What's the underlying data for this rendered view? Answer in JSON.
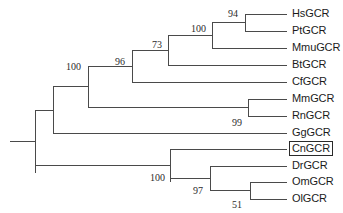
{
  "figure": {
    "type": "phylogenetic-tree",
    "layout": "rectangular-cladogram",
    "background_color": "#ffffff",
    "line_color": "#4a4a4a",
    "text_color": "#1b1b1b",
    "width": 343,
    "height": 213
  },
  "taxa": [
    {
      "id": "hs",
      "label": "HsGCR",
      "y": 14,
      "tip_x": 287,
      "branch_start_x": 245,
      "highlighted": false
    },
    {
      "id": "pt",
      "label": "PtGCR",
      "y": 31,
      "tip_x": 287,
      "branch_start_x": 245,
      "highlighted": false
    },
    {
      "id": "mmu",
      "label": "MmuGCR",
      "y": 48,
      "tip_x": 287,
      "branch_start_x": 212,
      "highlighted": false
    },
    {
      "id": "bt",
      "label": "BtGCR",
      "y": 65,
      "tip_x": 287,
      "branch_start_x": 168,
      "highlighted": false
    },
    {
      "id": "cf",
      "label": "CfGCR",
      "y": 82,
      "tip_x": 287,
      "branch_start_x": 132,
      "highlighted": false
    },
    {
      "id": "mm",
      "label": "MmGCR",
      "y": 99,
      "tip_x": 287,
      "branch_start_x": 248,
      "highlighted": false
    },
    {
      "id": "rn",
      "label": "RnGCR",
      "y": 116,
      "tip_x": 287,
      "branch_start_x": 248,
      "highlighted": false
    },
    {
      "id": "gg",
      "label": "GgGCR",
      "y": 133,
      "tip_x": 287,
      "branch_start_x": 53,
      "highlighted": false
    },
    {
      "id": "cn",
      "label": "CnGCR",
      "y": 149,
      "tip_x": 287,
      "branch_start_x": 170,
      "highlighted": true
    },
    {
      "id": "dr",
      "label": "DrGCR",
      "y": 166,
      "tip_x": 287,
      "branch_start_x": 210,
      "highlighted": false
    },
    {
      "id": "om",
      "label": "OmGCR",
      "y": 182,
      "tip_x": 287,
      "branch_start_x": 250,
      "highlighted": false
    },
    {
      "id": "ol",
      "label": "OlGCR",
      "y": 199,
      "tip_x": 287,
      "branch_start_x": 250,
      "highlighted": false
    }
  ],
  "internal_nodes": [
    {
      "id": "n-hs-pt",
      "bootstrap": "94",
      "x": 245,
      "y_top": 14,
      "y_bottom": 31,
      "parent_x": 212,
      "label_x": 228,
      "label_y": 9
    },
    {
      "id": "n-primates",
      "bootstrap": "100",
      "x": 212,
      "y_top": 22,
      "y_bottom": 48,
      "parent_x": 168,
      "label_x": 191,
      "label_y": 24
    },
    {
      "id": "n-euarchonta",
      "bootstrap": "73",
      "x": 168,
      "y_top": 35,
      "y_bottom": 65,
      "parent_x": 132,
      "label_x": 152,
      "label_y": 40
    },
    {
      "id": "n-laurasiatheria",
      "bootstrap": "96",
      "x": 132,
      "y_top": 50,
      "y_bottom": 82,
      "parent_x": 88,
      "label_x": 115,
      "label_y": 57
    },
    {
      "id": "n-rodents",
      "bootstrap": "99",
      "x": 248,
      "y_top": 99,
      "y_bottom": 116,
      "parent_x": 88,
      "label_x": 232,
      "label_y": 118
    },
    {
      "id": "n-mammals",
      "bootstrap": "100",
      "x": 88,
      "y_top": 66,
      "y_bottom": 107,
      "parent_x": 53,
      "label_x": 66,
      "label_y": 62
    },
    {
      "id": "n-amniota",
      "bootstrap": "",
      "x": 53,
      "y_top": 87,
      "y_bottom": 133,
      "parent_x": 35,
      "label_x": 0,
      "label_y": 0
    },
    {
      "id": "n-fish",
      "bootstrap": "100",
      "x": 170,
      "y_top": 149,
      "y_bottom": 182,
      "parent_x": 35,
      "label_x": 150,
      "label_y": 173
    },
    {
      "id": "n-teleost",
      "bootstrap": "97",
      "x": 210,
      "y_top": 166,
      "y_bottom": 190,
      "parent_x": 170,
      "label_x": 193,
      "label_y": 186
    },
    {
      "id": "n-om-ol",
      "bootstrap": "51",
      "x": 250,
      "y_top": 182,
      "y_bottom": 199,
      "parent_x": 210,
      "label_x": 232,
      "label_y": 200
    },
    {
      "id": "n-root",
      "bootstrap": "",
      "x": 35,
      "y_top": 110,
      "y_bottom": 173,
      "parent_x": 10,
      "label_x": 0,
      "label_y": 0
    }
  ],
  "bootstrap_values": [
    "94",
    "100",
    "73",
    "96",
    "99",
    "100",
    "100",
    "97",
    "51"
  ],
  "highlight": {
    "taxon": "CnGCR",
    "style": "black-rectangle-outline"
  }
}
